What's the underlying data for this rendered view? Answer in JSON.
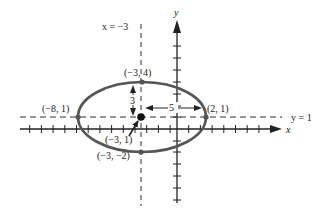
{
  "diagram": {
    "title": "",
    "type": "ellipse-graph",
    "axes": {
      "x_label": "x",
      "y_label": "y"
    },
    "asymptote_lines": {
      "vertical_label": "x = −3",
      "horizontal_label": "y = 1"
    },
    "points": [
      {
        "name": "top-vertex",
        "label": "(−3, 4)"
      },
      {
        "name": "left-vertex",
        "label": "(−8, 1)"
      },
      {
        "name": "right-vertex",
        "label": "(2, 1)"
      },
      {
        "name": "center",
        "label": "(−3, 1)"
      },
      {
        "name": "bottom-vertex",
        "label": "(−3, −2)"
      }
    ],
    "dimensions": {
      "vertical_semi_axis": "3",
      "horizontal_semi_axis": "5"
    },
    "colors": {
      "ellipse": "#555555",
      "axes": "#222222",
      "dashed": "#333333",
      "points": "#444444"
    }
  }
}
